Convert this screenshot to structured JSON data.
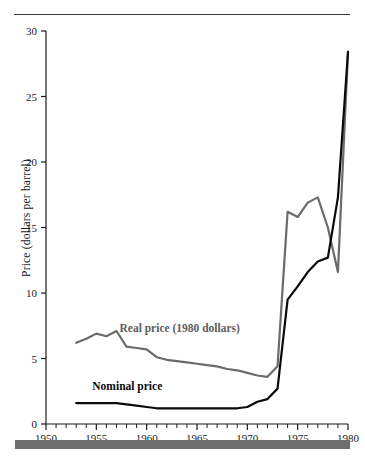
{
  "chart_data": {
    "type": "line",
    "title": "",
    "xlabel": "",
    "ylabel": "Price (dollars per barrel)",
    "xlim": [
      1950,
      1980
    ],
    "ylim": [
      0,
      30
    ],
    "xticks": [
      1950,
      1955,
      1960,
      1965,
      1970,
      1975,
      1980
    ],
    "xtick_labels": [
      "1950",
      "1955",
      "1960",
      "1965",
      "1970",
      "1975",
      "1980"
    ],
    "xtick_minor_step": 1,
    "yticks": [
      0,
      5,
      10,
      15,
      20,
      25,
      30
    ],
    "ytick_labels": [
      "0",
      "5",
      "10",
      "15",
      "20",
      "25",
      "30"
    ],
    "grid": false,
    "legend_position": "inline-annotations",
    "series": [
      {
        "name": "Real price (1980 dollars)",
        "color": "#6b6b6b",
        "label_x": 1957.3,
        "label_y": 7.0,
        "x": [
          1953,
          1954,
          1955,
          1956,
          1957,
          1958,
          1959,
          1960,
          1961,
          1962,
          1963,
          1964,
          1965,
          1966,
          1967,
          1968,
          1969,
          1970,
          1971,
          1972,
          1973,
          1974,
          1975,
          1976,
          1977,
          1978,
          1979,
          1980
        ],
        "y": [
          6.2,
          6.5,
          6.9,
          6.7,
          7.1,
          5.9,
          5.8,
          5.7,
          5.1,
          4.9,
          4.8,
          4.7,
          4.6,
          4.5,
          4.4,
          4.2,
          4.1,
          3.9,
          3.7,
          3.6,
          4.4,
          16.2,
          15.8,
          16.9,
          17.3,
          15.0,
          11.6,
          28.4
        ]
      },
      {
        "name": "Nominal price",
        "color": "#0a0a0a",
        "label_x": 1954.6,
        "label_y": 2.6,
        "x": [
          1953,
          1954,
          1955,
          1956,
          1957,
          1958,
          1959,
          1960,
          1961,
          1962,
          1963,
          1964,
          1965,
          1966,
          1967,
          1968,
          1969,
          1970,
          1971,
          1972,
          1973,
          1974,
          1975,
          1976,
          1977,
          1978,
          1979,
          1980
        ],
        "y": [
          1.6,
          1.6,
          1.6,
          1.6,
          1.6,
          1.5,
          1.4,
          1.3,
          1.2,
          1.2,
          1.2,
          1.2,
          1.2,
          1.2,
          1.2,
          1.2,
          1.2,
          1.3,
          1.7,
          1.9,
          2.7,
          9.5,
          10.5,
          11.6,
          12.4,
          12.7,
          17.3,
          28.4
        ]
      }
    ],
    "annotations": [
      {
        "text": "Real price (1980 dollars)",
        "series": "Real price (1980 dollars)"
      },
      {
        "text": "Nominal price",
        "series": "Nominal price"
      }
    ],
    "decorations": {
      "top_rule_color": "#3a3a3a",
      "bottom_bar_color": "#6f6f6f",
      "axis_color": "#1a1a1a",
      "background": "#ffffff"
    }
  }
}
